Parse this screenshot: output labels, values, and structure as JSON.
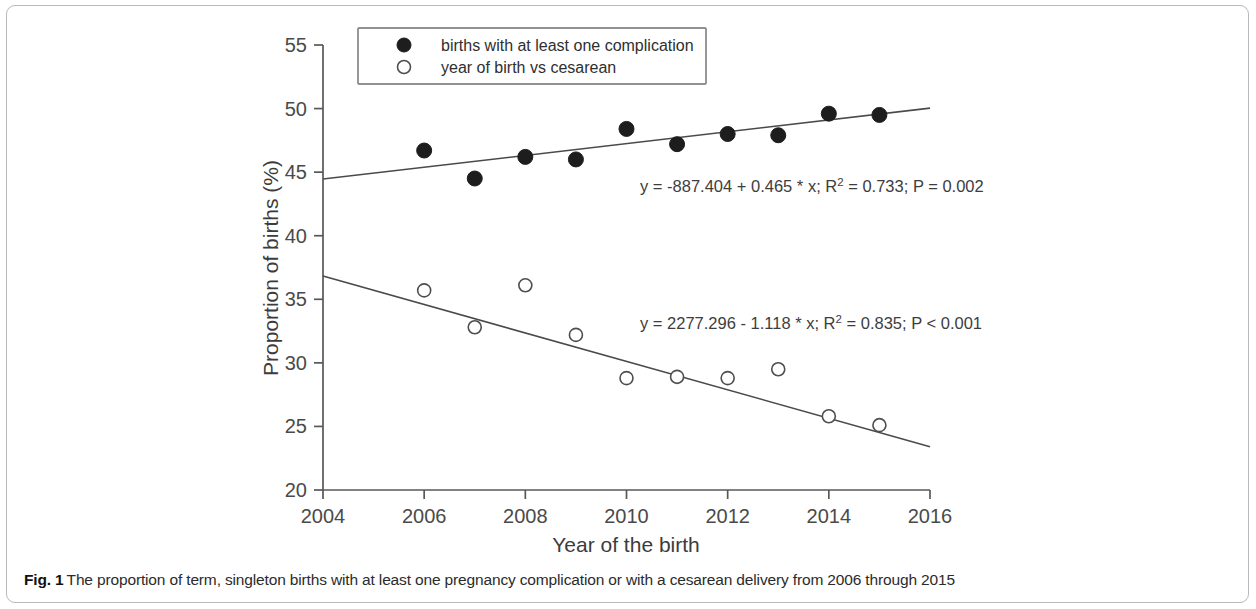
{
  "figure": {
    "caption_label": "Fig. 1",
    "caption_text": "The proportion of term, singleton births with at least one pregnancy complication or with a cesarean delivery from 2006 through 2015"
  },
  "legend": {
    "items": [
      {
        "marker": "filled-circle-marker",
        "label": "births with at least one complication"
      },
      {
        "marker": "open-circle-marker",
        "label": "year of birth vs cesarean"
      }
    ]
  },
  "annotations": {
    "complication_eq_part1": "y = -887.404 + 0.465 * x; R",
    "complication_eq_sup": "2",
    "complication_eq_part2": " = 0.733; P = 0.002",
    "cesarean_eq_part1": "y = 2277.296 - 1.118 * x; R",
    "cesarean_eq_sup": "2",
    "cesarean_eq_part2": " = 0.835; P < 0.001"
  },
  "chart_data": {
    "type": "scatter",
    "title": "",
    "xlabel": "Year of the birth",
    "ylabel": "Proportion of births (%)",
    "xlim": [
      2004,
      2016
    ],
    "ylim": [
      20,
      55
    ],
    "xticks": [
      2004,
      2006,
      2008,
      2010,
      2012,
      2014,
      2016
    ],
    "yticks": [
      20,
      25,
      30,
      35,
      40,
      45,
      50,
      55
    ],
    "grid": false,
    "legend_position": "top-center",
    "x": [
      2006,
      2007,
      2008,
      2009,
      2010,
      2011,
      2012,
      2013,
      2014,
      2015
    ],
    "series": [
      {
        "name": "births with at least one complication",
        "marker": "filled-circle",
        "values": [
          46.7,
          44.5,
          46.2,
          46.0,
          48.4,
          47.2,
          48.0,
          47.9,
          49.6,
          49.5
        ],
        "fit": {
          "label": "y = -887.404 + 0.465 * x; R2 = 0.733; P = 0.002",
          "intercept": -887.404,
          "slope": 0.465,
          "r_squared": 0.733,
          "p_value": "0.002",
          "x_start": 2004,
          "x_end": 2016
        }
      },
      {
        "name": "year of birth vs cesarean",
        "marker": "open-circle",
        "values": [
          35.7,
          32.8,
          36.1,
          32.2,
          28.8,
          28.9,
          28.8,
          29.5,
          25.8,
          25.1
        ],
        "fit": {
          "label": "y = 2277.296 - 1.118 * x; R2 = 0.835; P < 0.001",
          "intercept": 2277.296,
          "slope": -1.118,
          "r_squared": 0.835,
          "p_value": "< 0.001",
          "x_start": 2004,
          "x_end": 2016
        }
      }
    ]
  }
}
